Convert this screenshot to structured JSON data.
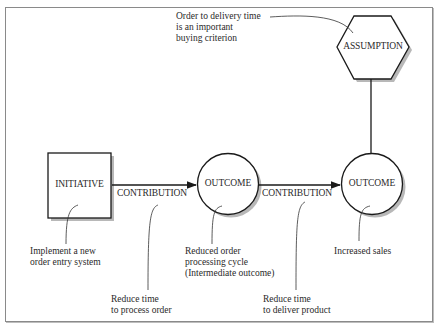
{
  "diagram": {
    "nodes": {
      "initiative": {
        "label": "INITIATIVE",
        "shape": "square"
      },
      "outcome_1": {
        "label": "OUTCOME",
        "shape": "circle"
      },
      "outcome_2": {
        "label": "OUTCOME",
        "shape": "circle"
      },
      "assumption": {
        "label": "ASSUMPTION",
        "shape": "hexagon"
      }
    },
    "edges": {
      "contribution_1": {
        "label": "CONTRIBUTION",
        "from": "initiative",
        "to": "outcome_1"
      },
      "contribution_2": {
        "label": "CONTRIBUTION",
        "from": "outcome_1",
        "to": "outcome_2"
      },
      "assumption_link": {
        "from": "assumption",
        "to": "outcome_2"
      }
    },
    "annotations": {
      "assumption_note": "Order to delivery time\nis an important\nbuying criterion",
      "initiative_note": "Implement a new\norder entry system",
      "contribution_1_note": "Reduce time\nto process order",
      "outcome_1_note": "Reduced order\nprocessing cycle\n(Intermediate outcome)",
      "contribution_2_note": "Reduce time\nto deliver product",
      "outcome_2_note": "Increased sales"
    },
    "colors": {
      "stroke": "#1a1a1a",
      "shadow": "#b5b5b5",
      "frame": "#8a8a8a",
      "background": "#ffffff"
    }
  }
}
